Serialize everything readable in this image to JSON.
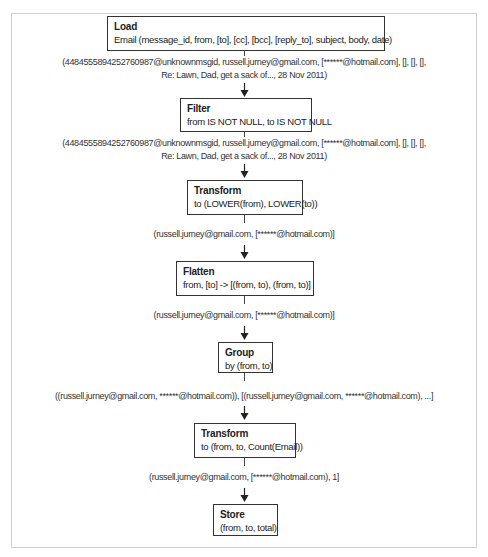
{
  "diagram": {
    "type": "flowchart",
    "direction": "top-to-bottom",
    "nodes": [
      {
        "id": "load",
        "title": "Load",
        "body": "Email (message_id, from, [to], [cc], [bcc], [reply_to], subject, body, date)"
      },
      {
        "id": "filter",
        "title": "Filter",
        "body": "from IS NOT NULL, to IS NOT NULL"
      },
      {
        "id": "transform1",
        "title": "Transform",
        "body": "to (LOWER(from), LOWER(to))"
      },
      {
        "id": "flatten",
        "title": "Flatten",
        "body": "from, [to] -> [(from, to), (from, to)]"
      },
      {
        "id": "group",
        "title": "Group",
        "body": "by (from, to)"
      },
      {
        "id": "transform2",
        "title": "Transform",
        "body": "to (from, to, Count(Email))"
      },
      {
        "id": "store",
        "title": "Store",
        "body": "(from, to, total)"
      }
    ],
    "edges": [
      {
        "from": "load",
        "to": "filter",
        "line1": "(448455589425276098​7@unknownmsgid, russell.jurney@gmail.com, [******@hotmail.com], [], [], [],",
        "line2": "Re: Lawn, Dad, get a sack of..., 28 Nov 2011)"
      },
      {
        "from": "filter",
        "to": "transform1",
        "line1": "(448455589425276098​7@unknownmsgid, russell.jurney@gmail.com, [******@hotmail.com], [], [], [],",
        "line2": "Re: Lawn, Dad, get a sack of..., 28 Nov 2011)"
      },
      {
        "from": "transform1",
        "to": "flatten",
        "line1": "(russell.jurney@gmail.com, [******@hotmail.com)]"
      },
      {
        "from": "flatten",
        "to": "group",
        "line1": "(russell.jurney@gmail.com, [******@hotmail.com)]"
      },
      {
        "from": "group",
        "to": "transform2",
        "line1": "((russell.jurney@gmail.com, ******@hotmail.com)), [(russell.jurney@gmail.com, ******@hotmail.com), ...]"
      },
      {
        "from": "transform2",
        "to": "store",
        "line1": "(russell.jurney@gmail.com, [******@hotmail.com), 1]"
      }
    ]
  }
}
